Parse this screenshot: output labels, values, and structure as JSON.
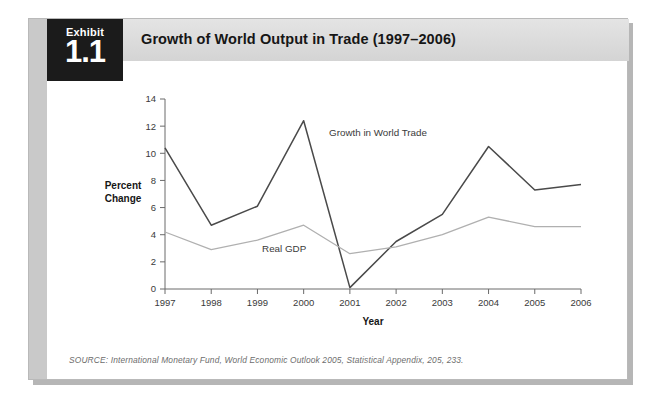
{
  "exhibit": {
    "badge_word": "Exhibit",
    "badge_number": "1.1",
    "title": "Growth of World Output in Trade (1997–2006)",
    "source": "SOURCE: International Monetary Fund, World Economic Outlook 2005, Statistical Appendix, 205, 233."
  },
  "colors": {
    "badge_background": "#1b1b1b",
    "header_background": "#d9d9d9",
    "frame_border": "#b9b9b9",
    "left_band": "#c9c9c9",
    "world_trade_line": "#4a4a4a",
    "real_gdp_line": "#b0b0b0",
    "axis": "#6a6a6a",
    "page_background": "#ffffff"
  },
  "chart_data": {
    "type": "line",
    "title": "Growth of World Output in Trade (1997–2006)",
    "xlabel": "Year",
    "ylabel": "Percent Change",
    "categories": [
      "1997",
      "1998",
      "1999",
      "2000",
      "2001",
      "2002",
      "2003",
      "2004",
      "2005",
      "2006"
    ],
    "x": [
      1997,
      1998,
      1999,
      2000,
      2001,
      2002,
      2003,
      2004,
      2005,
      2006
    ],
    "ylim": [
      0,
      14
    ],
    "xlim": [
      1997,
      2006
    ],
    "yticks": [
      0,
      2,
      4,
      6,
      8,
      10,
      12,
      14
    ],
    "ytick_labels": [
      "0",
      "2",
      "4",
      "6",
      "8",
      "10",
      "12",
      "14"
    ],
    "grid": false,
    "legend": "inline-annotations",
    "series": [
      {
        "name": "Growth in World Trade",
        "color": "#4a4a4a",
        "values": [
          10.4,
          4.7,
          6.1,
          12.4,
          0.1,
          3.5,
          5.5,
          10.5,
          7.3,
          7.7
        ]
      },
      {
        "name": "Real GDP",
        "color": "#b0b0b0",
        "values": [
          4.2,
          2.9,
          3.6,
          4.7,
          2.6,
          3.1,
          4.0,
          5.3,
          4.6,
          4.6
        ]
      }
    ],
    "annotations": [
      {
        "text": "Growth in World Trade",
        "x": 2000.55,
        "y": 11.25
      },
      {
        "text": "Real GDP",
        "x": 1999.1,
        "y": 2.75
      }
    ]
  }
}
